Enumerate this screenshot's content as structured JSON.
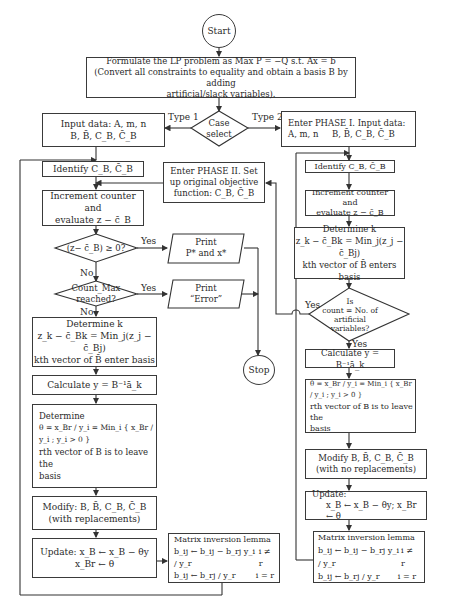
{
  "start": "Start",
  "stop": "Stop",
  "formulate": {
    "line1": "Formulate the LP problem as Max P = −Q s.t. Ax = b",
    "line2": "(Convert all constraints to equality and obtain a basis B by adding",
    "line3": "artificial/slack variables)."
  },
  "case_select": {
    "line1": "Case",
    "line2": "select",
    "type1": "Type 1",
    "type2": "Type 2"
  },
  "left": {
    "input": {
      "line1": "Input data: A, m, n",
      "line2": "B, B̄, C_B, C̄_B"
    },
    "identify": "Identify C_B, C̄_B",
    "increment": {
      "line1": "Increment counter and",
      "line2": "evaluate z − c̄_B"
    },
    "decision1": "(z− c̄_B) ≥ 0?",
    "decision2": {
      "line1": "Count_Max",
      "line2": "reached?"
    },
    "yes": "Yes",
    "no": "No",
    "print1": {
      "line1": "Print",
      "line2": "P* and x*"
    },
    "print2": {
      "line1": "Print",
      "line2": "“Error”"
    },
    "determine_k": {
      "line1": "Determine k",
      "line2": "z_k − c̄_Bk = Min_j(z_j − c̄_Bj)",
      "line3": "kth vector of B̄ enter basis"
    },
    "calculate": "Calculate y = B⁻¹ā_k",
    "determine_theta": {
      "line1": "Determine",
      "line2": "θ = x_Br / y_i = Min_i { x_Br / y_i ; y_i > 0 }",
      "line3": "rth vector of B is to leave the",
      "line4": "basis"
    },
    "modify": {
      "line1": "Modify: B, B̄, C_B, C̄_B",
      "line2": "(with replacements)"
    },
    "update": {
      "line1": "Update: x_B ← x_B − θy",
      "line2": "x_Br ← θ"
    },
    "lemma": {
      "title": "Matrix inversion lemma",
      "row1": "b_ij ← b_ij − b_rj y_i / y_r",
      "row1_cond": "i ≠ r",
      "row2": "b_ij ← b_rj / y_r",
      "row2_cond": "i = r"
    }
  },
  "phase2": {
    "line1": "Enter PHASE II. Set",
    "line2": "up original objective",
    "line3": "function: C_B, C̄_B"
  },
  "right": {
    "input": {
      "line1": "Enter PHASE I. Input data:",
      "line2": "A, m, n",
      "line3": "B, B̄, C_B, C̄_B"
    },
    "identify": "Identify C_B, C̄_B",
    "increment": {
      "line1": "Increment counter and",
      "line2": "evaluate z − c̄_B"
    },
    "determine_k": {
      "line1": "Determine k",
      "line2": "z_k − c̄_Bk = Min_j(z_j − c̄_Bj)",
      "line3": "kth vector of B̄ enters basis"
    },
    "decision": {
      "line1": "Is",
      "line2": "count = No. of",
      "line3": "artificial variables?"
    },
    "yes_left": "Yes",
    "yes_down": "Yes",
    "calculate": "Calculate y = B⁻¹ā_k",
    "theta": {
      "line1": "θ = x_Br / y_i = Min_i { x_Br / y_i ; y_i > 0 }",
      "line2": "rth vector of B is to leave the",
      "line3": "basis"
    },
    "modify": {
      "line1": "Modify B, B̄, C_B, C̄_B",
      "line2": "(with no replacements)"
    },
    "update": {
      "line1": "Update:",
      "line2": "x_B ← x_B − θy; x_Br ← θ"
    },
    "lemma": {
      "title": "Matrix inversion lemma",
      "row1": "b_ij ← b_ij − b_rj y_i / y_r",
      "row1_cond": "i ≠ r",
      "row2": "b_ij ← b_rj / y_r",
      "row2_cond": "i = r"
    }
  }
}
